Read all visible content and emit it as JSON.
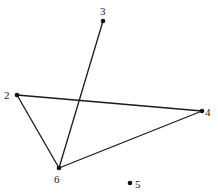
{
  "graph": {
    "nodes": [
      {
        "id": "2",
        "label": "2",
        "x": 17,
        "y": 95,
        "lx": 4,
        "ly": 99
      },
      {
        "id": "3",
        "label": "3",
        "x": 103,
        "y": 21,
        "lx": 100,
        "ly": 15
      },
      {
        "id": "4",
        "label": "4",
        "x": 202,
        "y": 111,
        "lx": 205,
        "ly": 116
      },
      {
        "id": "5",
        "label": "5",
        "x": 130,
        "y": 183,
        "lx": 135,
        "ly": 188
      },
      {
        "id": "6",
        "label": "6",
        "x": 59,
        "y": 168,
        "lx": 54,
        "ly": 183
      }
    ],
    "edges": [
      {
        "from": "3",
        "to": "6"
      },
      {
        "from": "2",
        "to": "4"
      },
      {
        "from": "2",
        "to": "6"
      },
      {
        "from": "6",
        "to": "4"
      }
    ]
  }
}
